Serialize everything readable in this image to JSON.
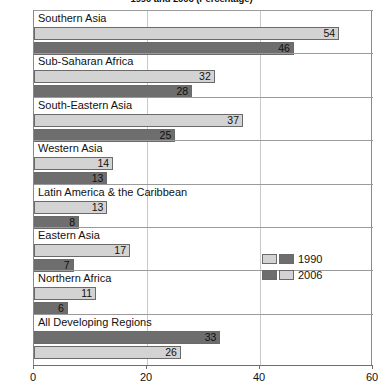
{
  "chart_data": {
    "type": "bar",
    "orientation": "horizontal",
    "title": "1990 and 2006 (Percentage)",
    "xlabel": "",
    "ylabel": "",
    "xlim": [
      0,
      60
    ],
    "xticks": [
      0,
      20,
      40,
      60
    ],
    "xtick_labels": [
      "0",
      "20",
      "40",
      "60"
    ],
    "grid": true,
    "grid_axis": "x",
    "legend": {
      "position": "middle-right",
      "entries": [
        {
          "name": "1990",
          "swatches": [
            "light",
            "dark"
          ]
        },
        {
          "name": "2006",
          "swatches": [
            "dark",
            "light"
          ]
        }
      ]
    },
    "colors": {
      "light": "#d3d3d3",
      "dark": "#6e6e6e",
      "axis": "#6e6e6e",
      "grid": "#c9c9c9"
    },
    "categories": [
      "Southern Asia",
      "Sub-Saharan Africa",
      "South-Eastern Asia",
      "Western Asia",
      "Latin America & the Caribbean",
      "Eastern Asia",
      "Northern Africa",
      "All Developing Regions"
    ],
    "series": [
      {
        "name": "1990",
        "values": [
          54,
          32,
          37,
          14,
          13,
          17,
          11,
          33
        ]
      },
      {
        "name": "2006",
        "values": [
          46,
          28,
          25,
          13,
          8,
          7,
          6,
          26
        ]
      }
    ],
    "groups": [
      {
        "label": "Southern Asia",
        "bars": [
          {
            "series": "1990",
            "value": 54,
            "value_label": "54",
            "shade": "light"
          },
          {
            "series": "2006",
            "value": 46,
            "value_label": "46",
            "shade": "dark"
          }
        ]
      },
      {
        "label": "Sub-Saharan Africa",
        "bars": [
          {
            "series": "1990",
            "value": 32,
            "value_label": "32",
            "shade": "light"
          },
          {
            "series": "2006",
            "value": 28,
            "value_label": "28",
            "shade": "dark"
          }
        ]
      },
      {
        "label": "South-Eastern Asia",
        "bars": [
          {
            "series": "1990",
            "value": 37,
            "value_label": "37",
            "shade": "light"
          },
          {
            "series": "2006",
            "value": 25,
            "value_label": "25",
            "shade": "dark"
          }
        ]
      },
      {
        "label": "Western Asia",
        "bars": [
          {
            "series": "1990",
            "value": 14,
            "value_label": "14",
            "shade": "light"
          },
          {
            "series": "2006",
            "value": 13,
            "value_label": "13",
            "shade": "dark"
          }
        ]
      },
      {
        "label": "Latin America & the Caribbean",
        "bars": [
          {
            "series": "1990",
            "value": 13,
            "value_label": "13",
            "shade": "light"
          },
          {
            "series": "2006",
            "value": 8,
            "value_label": "8",
            "shade": "dark"
          }
        ]
      },
      {
        "label": "Eastern Asia",
        "bars": [
          {
            "series": "1990",
            "value": 17,
            "value_label": "17",
            "shade": "light"
          },
          {
            "series": "2006",
            "value": 7,
            "value_label": "7",
            "shade": "dark"
          }
        ]
      },
      {
        "label": "Northern Africa",
        "bars": [
          {
            "series": "1990",
            "value": 11,
            "value_label": "11",
            "shade": "light"
          },
          {
            "series": "2006",
            "value": 6,
            "value_label": "6",
            "shade": "dark"
          }
        ]
      },
      {
        "label": "All Developing Regions",
        "bars": [
          {
            "series": "1990",
            "value": 33,
            "value_label": "33",
            "shade": "dark"
          },
          {
            "series": "2006",
            "value": 26,
            "value_label": "26",
            "shade": "light"
          }
        ]
      }
    ]
  }
}
